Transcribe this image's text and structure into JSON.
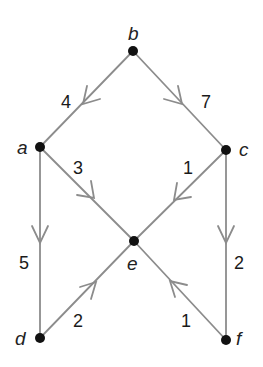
{
  "diagram": {
    "type": "weighted directed graph",
    "colors": {
      "edge": "#8c8c8c",
      "node": "#111111",
      "text": "#222222",
      "background": "#ffffff"
    },
    "nodes": [
      {
        "id": "b",
        "label": "b",
        "x": 133,
        "y": 51
      },
      {
        "id": "a",
        "label": "a",
        "x": 40,
        "y": 147
      },
      {
        "id": "c",
        "label": "c",
        "x": 226,
        "y": 150
      },
      {
        "id": "e",
        "label": "e",
        "x": 134,
        "y": 241
      },
      {
        "id": "d",
        "label": "d",
        "x": 40,
        "y": 338
      },
      {
        "id": "f",
        "label": "f",
        "x": 226,
        "y": 340
      }
    ],
    "edges": [
      {
        "from": "b",
        "to": "a",
        "weight": "4"
      },
      {
        "from": "b",
        "to": "c",
        "weight": "7"
      },
      {
        "from": "a",
        "to": "e",
        "weight": "3"
      },
      {
        "from": "c",
        "to": "e",
        "weight": "1"
      },
      {
        "from": "a",
        "to": "d",
        "weight": "5"
      },
      {
        "from": "c",
        "to": "f",
        "weight": "2"
      },
      {
        "from": "d",
        "to": "e",
        "weight": "2"
      },
      {
        "from": "f",
        "to": "e",
        "weight": "1"
      }
    ]
  }
}
